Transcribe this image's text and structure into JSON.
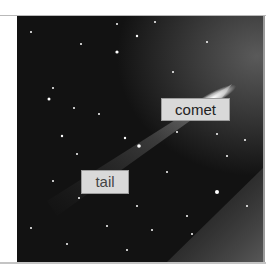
{
  "image": {
    "subject": "comet with tail against star field",
    "annotations": [
      {
        "id": "comet",
        "text": "comet"
      },
      {
        "id": "tail",
        "text": "tail"
      }
    ]
  }
}
